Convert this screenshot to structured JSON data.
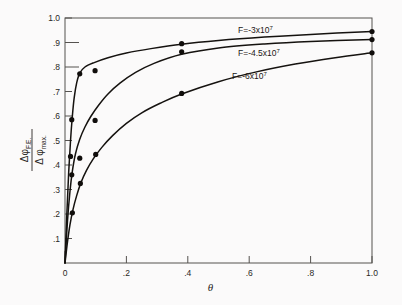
{
  "figure": {
    "background_color": "#fbfafa",
    "axis_color": "#55524f",
    "curve_color": "#15120f"
  },
  "chart_data": {
    "type": "line",
    "title": "",
    "xlabel": "θ",
    "ylabel_numerator": "Δφ",
    "ylabel_numerator_sub": "F.E.",
    "ylabel_denominator": "Δ φ",
    "ylabel_denominator_sub": "max.",
    "xlim": [
      0,
      1.0
    ],
    "ylim": [
      0,
      1.0
    ],
    "grid": false,
    "legend_position": "inline-annotations",
    "x_ticks": [
      0,
      0.2,
      0.4,
      0.6,
      0.8,
      1.0
    ],
    "x_tick_labels": [
      "0",
      ".2",
      ".4",
      ".6",
      ".8",
      "1.0"
    ],
    "y_ticks": [
      0.1,
      0.2,
      0.3,
      0.4,
      0.5,
      0.6,
      0.7,
      0.8,
      0.9,
      1.0
    ],
    "y_tick_labels": [
      ".1",
      ".2",
      ".3",
      ".4",
      ".5",
      ".6",
      ".7",
      ".8",
      ".9",
      "1.0"
    ],
    "series": [
      {
        "name": "F = −3 × 10⁷",
        "label_text": "F=-3x10",
        "label_exponent": "7",
        "marker": "filled-circle",
        "x": [
          0.005,
          0.018,
          0.045,
          0.095,
          0.38,
          1.0
        ],
        "y": [
          0.205,
          0.435,
          0.585,
          0.772,
          0.785,
          0.945
        ],
        "points": [
          {
            "x": 0.018,
            "y": 0.435
          },
          {
            "x": 0.022,
            "y": 0.585
          },
          {
            "x": 0.048,
            "y": 0.772
          },
          {
            "x": 0.098,
            "y": 0.785
          },
          {
            "x": 0.38,
            "y": 0.895
          },
          {
            "x": 1.0,
            "y": 0.945
          }
        ],
        "curve": [
          {
            "x": 0.0,
            "y": 0.0
          },
          {
            "x": 0.006,
            "y": 0.2
          },
          {
            "x": 0.012,
            "y": 0.37
          },
          {
            "x": 0.018,
            "y": 0.5
          },
          {
            "x": 0.024,
            "y": 0.6
          },
          {
            "x": 0.03,
            "y": 0.675
          },
          {
            "x": 0.038,
            "y": 0.735
          },
          {
            "x": 0.048,
            "y": 0.775
          },
          {
            "x": 0.065,
            "y": 0.8
          },
          {
            "x": 0.095,
            "y": 0.818
          },
          {
            "x": 0.14,
            "y": 0.838
          },
          {
            "x": 0.2,
            "y": 0.857
          },
          {
            "x": 0.28,
            "y": 0.875
          },
          {
            "x": 0.38,
            "y": 0.893
          },
          {
            "x": 0.5,
            "y": 0.908
          },
          {
            "x": 0.65,
            "y": 0.922
          },
          {
            "x": 0.8,
            "y": 0.933
          },
          {
            "x": 1.0,
            "y": 0.945
          }
        ]
      },
      {
        "name": "F = −4.5 × 10⁷",
        "label_text": "F=-4.5x10",
        "label_exponent": "7",
        "marker": "filled-circle",
        "x": [
          0.022,
          0.048,
          0.098,
          0.38,
          1.0
        ],
        "y": [
          0.36,
          0.428,
          0.582,
          0.862,
          0.912
        ],
        "points": [
          {
            "x": 0.022,
            "y": 0.36
          },
          {
            "x": 0.048,
            "y": 0.428
          },
          {
            "x": 0.098,
            "y": 0.582
          },
          {
            "x": 0.38,
            "y": 0.862
          },
          {
            "x": 1.0,
            "y": 0.912
          }
        ],
        "curve": [
          {
            "x": 0.0,
            "y": 0.0
          },
          {
            "x": 0.008,
            "y": 0.17
          },
          {
            "x": 0.016,
            "y": 0.29
          },
          {
            "x": 0.024,
            "y": 0.375
          },
          {
            "x": 0.034,
            "y": 0.445
          },
          {
            "x": 0.048,
            "y": 0.505
          },
          {
            "x": 0.065,
            "y": 0.555
          },
          {
            "x": 0.085,
            "y": 0.6
          },
          {
            "x": 0.11,
            "y": 0.645
          },
          {
            "x": 0.14,
            "y": 0.69
          },
          {
            "x": 0.18,
            "y": 0.735
          },
          {
            "x": 0.23,
            "y": 0.778
          },
          {
            "x": 0.29,
            "y": 0.815
          },
          {
            "x": 0.38,
            "y": 0.852
          },
          {
            "x": 0.5,
            "y": 0.878
          },
          {
            "x": 0.65,
            "y": 0.894
          },
          {
            "x": 0.8,
            "y": 0.904
          },
          {
            "x": 1.0,
            "y": 0.912
          }
        ]
      },
      {
        "name": "F = −6 × 10⁷",
        "label_text": "F=-6x10",
        "label_exponent": "7",
        "marker": "filled-circle",
        "x": [
          0.022,
          0.048,
          0.098,
          0.38,
          1.0
        ],
        "y": [
          0.205,
          0.325,
          0.443,
          0.692,
          0.858
        ],
        "points": [
          {
            "x": 0.024,
            "y": 0.205
          },
          {
            "x": 0.05,
            "y": 0.325
          },
          {
            "x": 0.1,
            "y": 0.443
          },
          {
            "x": 0.38,
            "y": 0.692
          },
          {
            "x": 1.0,
            "y": 0.858
          }
        ],
        "curve": [
          {
            "x": 0.0,
            "y": 0.0
          },
          {
            "x": 0.008,
            "y": 0.085
          },
          {
            "x": 0.016,
            "y": 0.155
          },
          {
            "x": 0.026,
            "y": 0.218
          },
          {
            "x": 0.038,
            "y": 0.275
          },
          {
            "x": 0.052,
            "y": 0.328
          },
          {
            "x": 0.07,
            "y": 0.378
          },
          {
            "x": 0.092,
            "y": 0.425
          },
          {
            "x": 0.12,
            "y": 0.472
          },
          {
            "x": 0.155,
            "y": 0.52
          },
          {
            "x": 0.2,
            "y": 0.57
          },
          {
            "x": 0.25,
            "y": 0.613
          },
          {
            "x": 0.31,
            "y": 0.652
          },
          {
            "x": 0.38,
            "y": 0.69
          },
          {
            "x": 0.5,
            "y": 0.74
          },
          {
            "x": 0.62,
            "y": 0.779
          },
          {
            "x": 0.75,
            "y": 0.812
          },
          {
            "x": 0.88,
            "y": 0.838
          },
          {
            "x": 1.0,
            "y": 0.858
          }
        ]
      }
    ],
    "annotations": [
      {
        "text": "F=-3x10",
        "exponent": "7",
        "x_px": 238,
        "y_px": 33
      },
      {
        "text": "F=-4.5x10",
        "exponent": "7",
        "x_px": 238,
        "y_px": 56
      },
      {
        "text": "F=-6x10",
        "exponent": "7",
        "x_px": 232,
        "y_px": 79
      }
    ]
  }
}
